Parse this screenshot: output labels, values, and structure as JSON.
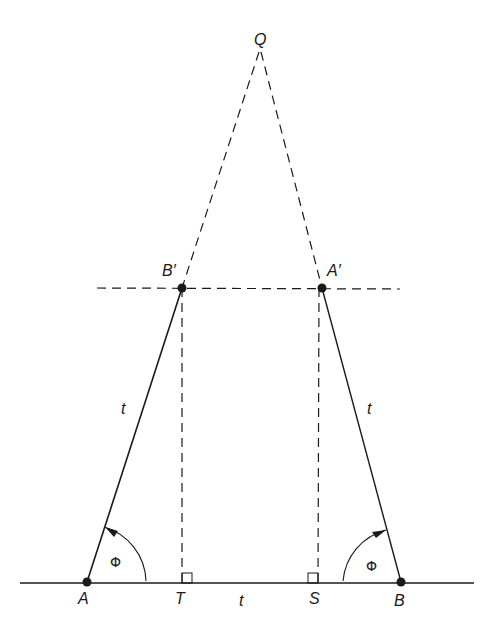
{
  "diagram": {
    "labels": {
      "Q": "Q",
      "B_prime": "B′",
      "A_prime": "A′",
      "A": "A",
      "B": "B",
      "T": "T",
      "S": "S",
      "t_left": "t",
      "t_right": "t",
      "t_bottom": "t",
      "phi_left": "Φ",
      "phi_right": "Φ"
    },
    "points": {
      "Q": [
        260,
        50
      ],
      "B_prime": [
        182,
        288
      ],
      "A_prime": [
        322,
        288
      ],
      "A": [
        87,
        582
      ],
      "B": [
        401,
        582
      ],
      "T": [
        182,
        582
      ],
      "S": [
        317,
        582
      ]
    },
    "colors": {
      "line": "#1a1a1a",
      "background": "#ffffff"
    }
  }
}
